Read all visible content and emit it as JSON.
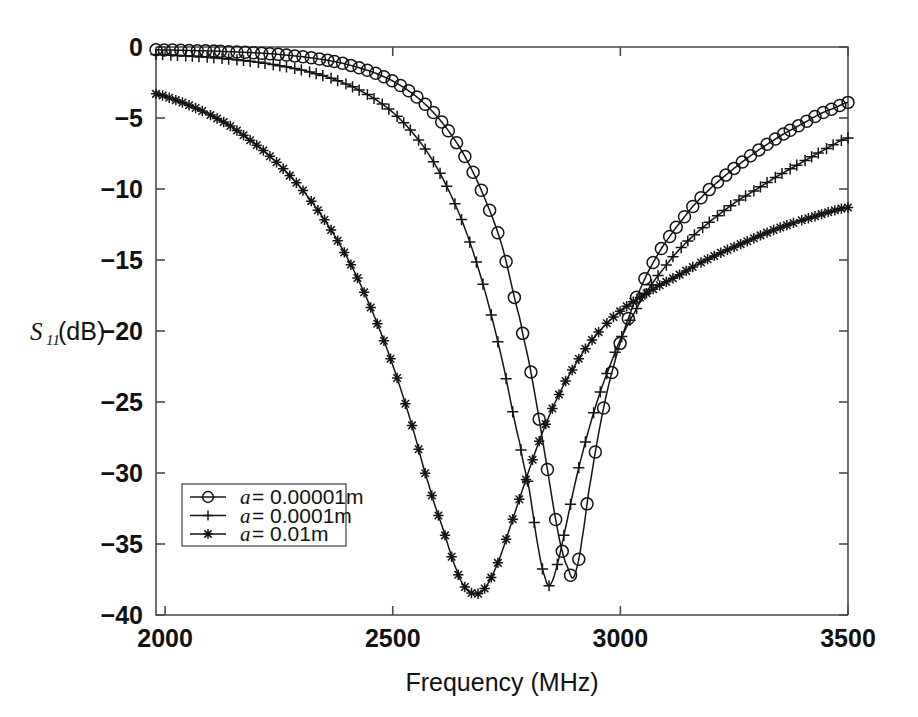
{
  "chart_data": {
    "type": "line",
    "title": "",
    "xlabel": "Frequency (MHz)",
    "ylabel": "S11(dB)",
    "ylabel_parts": {
      "main": "S",
      "sub": "11",
      "rest": "(dB)"
    },
    "xlim": [
      1980,
      3500
    ],
    "ylim": [
      -40,
      0
    ],
    "xticks": [
      2000,
      2500,
      3000,
      3500
    ],
    "xticklabels": [
      "2000",
      "2500",
      "3000",
      "3500"
    ],
    "yticks": [
      0,
      -5,
      -10,
      -15,
      -20,
      -25,
      -30,
      -35,
      -40
    ],
    "yticklabels": [
      "0",
      "−5",
      "−10",
      "−15",
      "−20",
      "−25",
      "−30",
      "−35",
      "−40"
    ],
    "grid": false,
    "legend_position": "lower-left",
    "legend": [
      {
        "label": "a = 0.00001m",
        "label_var": "a",
        "label_rest": "= 0.00001m",
        "marker": "circle"
      },
      {
        "label": "a = 0.0001m",
        "label_var": "a",
        "label_rest": "= 0.0001m",
        "marker": "plus"
      },
      {
        "label": "a = 0.01m",
        "label_var": "a",
        "label_rest": "= 0.01m",
        "marker": "star"
      }
    ],
    "colors": {
      "line": "#141414",
      "axis": "#4a4a4a",
      "background": "#ffffff"
    },
    "series": [
      {
        "name": "a = 0.00001m",
        "marker": "circle",
        "resonance_mhz": 2895,
        "min_db": -37.4,
        "x": [
          1980,
          2020,
          2060,
          2100,
          2140,
          2180,
          2220,
          2260,
          2300,
          2340,
          2380,
          2420,
          2460,
          2500,
          2540,
          2580,
          2620,
          2660,
          2700,
          2740,
          2780,
          2800,
          2820,
          2840,
          2860,
          2875,
          2885,
          2895,
          2905,
          2915,
          2930,
          2950,
          2970,
          2990,
          3010,
          3030,
          3060,
          3090,
          3120,
          3160,
          3200,
          3240,
          3280,
          3320,
          3360,
          3400,
          3440,
          3470,
          3500
        ],
        "y": [
          -0.2,
          -0.22,
          -0.25,
          -0.28,
          -0.33,
          -0.38,
          -0.45,
          -0.55,
          -0.68,
          -0.85,
          -1.08,
          -1.4,
          -1.82,
          -2.4,
          -3.2,
          -4.3,
          -5.8,
          -7.8,
          -10.5,
          -14.0,
          -19.2,
          -22.3,
          -25.9,
          -29.8,
          -33.6,
          -35.8,
          -36.7,
          -37.4,
          -36.6,
          -34.8,
          -31.4,
          -27.6,
          -24.4,
          -21.9,
          -19.8,
          -18.0,
          -15.9,
          -14.2,
          -12.8,
          -11.2,
          -9.9,
          -8.8,
          -7.8,
          -6.9,
          -6.1,
          -5.4,
          -4.7,
          -4.3,
          -3.9
        ]
      },
      {
        "name": "a = 0.0001m",
        "marker": "plus",
        "resonance_mhz": 2840,
        "min_db": -37.9,
        "x": [
          1980,
          2020,
          2060,
          2100,
          2140,
          2180,
          2220,
          2260,
          2300,
          2340,
          2380,
          2420,
          2460,
          2500,
          2540,
          2580,
          2620,
          2660,
          2700,
          2740,
          2780,
          2800,
          2820,
          2835,
          2845,
          2860,
          2880,
          2900,
          2920,
          2940,
          2960,
          2980,
          3000,
          3020,
          3050,
          3080,
          3120,
          3160,
          3200,
          3250,
          3300,
          3350,
          3400,
          3450,
          3500
        ],
        "y": [
          -0.52,
          -0.58,
          -0.65,
          -0.74,
          -0.85,
          -0.98,
          -1.15,
          -1.36,
          -1.62,
          -1.95,
          -2.38,
          -2.93,
          -3.65,
          -4.6,
          -5.9,
          -7.6,
          -9.9,
          -12.9,
          -16.9,
          -22.0,
          -28.0,
          -31.2,
          -35.3,
          -37.4,
          -37.9,
          -36.6,
          -33.8,
          -30.8,
          -28.2,
          -25.9,
          -23.9,
          -22.2,
          -20.6,
          -19.3,
          -17.6,
          -16.2,
          -14.6,
          -13.3,
          -12.2,
          -11.0,
          -10.0,
          -9.0,
          -8.1,
          -7.2,
          -6.4
        ]
      },
      {
        "name": "a = 0.01m",
        "marker": "star",
        "resonance_mhz": 2670,
        "min_db": -38.6,
        "x": [
          1980,
          2020,
          2060,
          2100,
          2140,
          2180,
          2220,
          2260,
          2300,
          2340,
          2380,
          2420,
          2460,
          2500,
          2540,
          2580,
          2610,
          2640,
          2660,
          2680,
          2700,
          2730,
          2760,
          2790,
          2820,
          2850,
          2880,
          2920,
          2960,
          3000,
          3040,
          3080,
          3120,
          3170,
          3220,
          3270,
          3320,
          3370,
          3420,
          3460,
          3500
        ],
        "y": [
          -3.3,
          -3.7,
          -4.2,
          -4.8,
          -5.5,
          -6.4,
          -7.4,
          -8.6,
          -10.0,
          -11.7,
          -13.7,
          -16.1,
          -19.0,
          -22.4,
          -26.4,
          -30.9,
          -33.9,
          -36.8,
          -38.1,
          -38.5,
          -38.2,
          -36.4,
          -33.6,
          -30.7,
          -27.9,
          -25.5,
          -23.5,
          -21.4,
          -19.8,
          -18.6,
          -17.7,
          -16.9,
          -16.2,
          -15.3,
          -14.5,
          -13.8,
          -13.1,
          -12.5,
          -12.0,
          -11.6,
          -11.3
        ]
      }
    ]
  }
}
